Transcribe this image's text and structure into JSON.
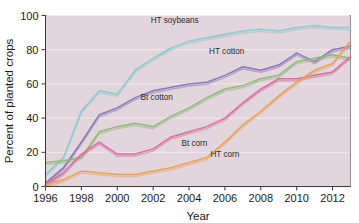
{
  "chart_data": {
    "type": "line",
    "title": "",
    "xlabel": "Year",
    "ylabel": "Percent of planted crops",
    "xlim": [
      1996,
      2013
    ],
    "ylim": [
      0,
      100
    ],
    "grid": true,
    "legend_position": "inline-annotations",
    "x": [
      1996,
      1997,
      1998,
      1999,
      2000,
      2001,
      2002,
      2003,
      2004,
      2005,
      2006,
      2007,
      2008,
      2009,
      2010,
      2011,
      2012,
      2013
    ],
    "xticks": [
      "1996",
      "1998",
      "2000",
      "2002",
      "2004",
      "2006",
      "2008",
      "2010",
      "2012"
    ],
    "xtick_values": [
      1996,
      1998,
      2000,
      2002,
      2004,
      2006,
      2008,
      2010,
      2012
    ],
    "yticks": [
      "0",
      "20",
      "40",
      "60",
      "80",
      "100"
    ],
    "ytick_values": [
      0,
      20,
      40,
      60,
      80,
      100
    ],
    "series": [
      {
        "name": "HT soybeans",
        "color": "#8ec9cf",
        "label": "HT soybeans",
        "label_x": 2003.2,
        "label_y": 95.5,
        "values": [
          7,
          17,
          44,
          56,
          54,
          68,
          75,
          81,
          85,
          87,
          89,
          91,
          92,
          91,
          93,
          94,
          93,
          93
        ]
      },
      {
        "name": "HT cotton",
        "color": "#8878b8",
        "label": "HT cotton",
        "label_x": 2006.1,
        "label_y": 77.5,
        "values": [
          2,
          11,
          26,
          42,
          46,
          52,
          56,
          58,
          60,
          61,
          65,
          70,
          68,
          71,
          78,
          73,
          80,
          82
        ]
      },
      {
        "name": "Bt cotton",
        "color": "#8fb87a",
        "label": "Bt cotton",
        "label_x": 2002.2,
        "label_y": 50.5,
        "values": [
          14,
          15,
          17,
          32,
          35,
          37,
          35,
          41,
          46,
          52,
          57,
          59,
          63,
          65,
          73,
          75,
          77,
          75
        ]
      },
      {
        "name": "Bt corn",
        "color": "#d4709f",
        "label": "Bt corn",
        "label_x": 2004.3,
        "label_y": 23.5,
        "values": [
          1,
          8,
          19,
          26,
          19,
          19,
          22,
          29,
          32,
          35,
          40,
          49,
          57,
          63,
          63,
          65,
          67,
          76
        ]
      },
      {
        "name": "HT corn",
        "color": "#e8a15c",
        "label": "HT corn",
        "label_x": 2006.0,
        "label_y": 17.5,
        "values": [
          1,
          4,
          9,
          8,
          7,
          7,
          9,
          11,
          14,
          17,
          26,
          36,
          44,
          53,
          61,
          68,
          72,
          85
        ]
      }
    ]
  }
}
